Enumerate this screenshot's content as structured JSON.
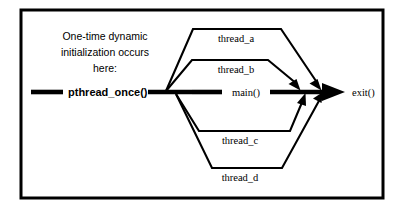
{
  "figure": {
    "type": "flow-diagram",
    "background_color": "#ffffff",
    "stroke_color": "#000000",
    "border": {
      "name": "figure-border",
      "x": 21,
      "y": 10,
      "width": 362,
      "height": 188,
      "thickness": 3
    }
  },
  "caption": {
    "line1": "One-time dynamic",
    "line2": "initialization occurs",
    "line3": "here:"
  },
  "nodes": {
    "once": {
      "label": "pthread_once()"
    },
    "main": {
      "label": "main()"
    },
    "exit": {
      "label": "exit()"
    }
  },
  "threads": [
    {
      "id": "thread-a",
      "label": "thread_a",
      "position": "upper-outer"
    },
    {
      "id": "thread-b",
      "label": "thread_b",
      "position": "upper-inner"
    },
    {
      "id": "thread-c",
      "label": "thread_c",
      "position": "lower-inner"
    },
    {
      "id": "thread-d",
      "label": "thread_d",
      "position": "lower-outer"
    }
  ]
}
